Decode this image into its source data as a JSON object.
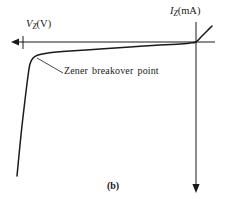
{
  "figure": {
    "caption": "(b)",
    "background_color": "#ffffff",
    "ink_color": "#1a1a1a"
  },
  "axes": {
    "horizontal": {
      "symbol": "V",
      "subscript": "Z",
      "unit": "(V)",
      "full_label": "V_Z (V)",
      "direction": "left",
      "arrow": "left-arrowhead",
      "tick_present": true
    },
    "vertical": {
      "symbol": "I",
      "subscript": "Z",
      "unit": "(mA)",
      "full_label": "I_Z (mA)",
      "direction": "down",
      "arrow": "down-arrowhead"
    }
  },
  "annotations": [
    {
      "name": "zener-breakover-point",
      "text": "Zener breakover point",
      "leader_from": [
        37,
        58
      ],
      "leader_to": [
        63,
        73
      ]
    }
  ],
  "chart_data": {
    "type": "line",
    "title": "",
    "subtitle": "",
    "xlabel": "V_Z (V)",
    "ylabel": "I_Z (mA)",
    "grid": false,
    "legend": null,
    "axis_origin_px": [
      196,
      42
    ],
    "x_axis_extent_px": [
      12,
      215
    ],
    "y_axis_extent_px": [
      22,
      192
    ],
    "series": [
      {
        "name": "zener-characteristic",
        "points_px": [
          [
            17,
            176
          ],
          [
            21,
            135
          ],
          [
            25,
            100
          ],
          [
            28,
            76
          ],
          [
            30,
            64
          ],
          [
            33,
            58
          ],
          [
            38,
            55
          ],
          [
            48,
            53
          ],
          [
            70,
            51
          ],
          [
            100,
            49
          ],
          [
            130,
            47
          ],
          [
            160,
            45
          ],
          [
            180,
            44
          ],
          [
            190,
            43
          ],
          [
            196,
            42
          ],
          [
            202,
            36
          ],
          [
            207,
            31
          ],
          [
            212,
            26
          ]
        ]
      }
    ],
    "breakover_point_px": [
      33,
      58
    ]
  }
}
